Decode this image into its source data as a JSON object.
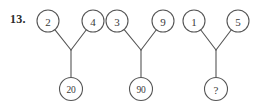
{
  "problem": {
    "number_label": "13.",
    "type": "number-tree-puzzle"
  },
  "style": {
    "stroke_color": "#555555",
    "text_color": "#3a3a3a",
    "label_color": "#2b2b2b",
    "background": "#ffffff",
    "stroke_width": 1.1,
    "circle_radius_top": 11,
    "circle_radius_bottom": 11.5
  },
  "trees": [
    {
      "id": "tree-1",
      "left_value": "2",
      "right_value": "4",
      "result_value": "20",
      "left_cx": 48,
      "left_cy": 21,
      "right_cx": 93,
      "right_cy": 21,
      "join_x": 71,
      "join_y": 50,
      "result_cx": 71,
      "result_cy": 89
    },
    {
      "id": "tree-2",
      "left_value": "3",
      "right_value": "9",
      "result_value": "90",
      "left_cx": 117,
      "left_cy": 21,
      "right_cx": 163,
      "right_cy": 21,
      "join_x": 141,
      "join_y": 50,
      "result_cx": 141,
      "result_cy": 89
    },
    {
      "id": "tree-3",
      "left_value": "1",
      "right_value": "5",
      "result_value": "?",
      "left_cx": 194,
      "left_cy": 21,
      "right_cx": 238,
      "right_cy": 21,
      "join_x": 216,
      "join_y": 50,
      "result_cx": 216,
      "result_cy": 89
    }
  ]
}
